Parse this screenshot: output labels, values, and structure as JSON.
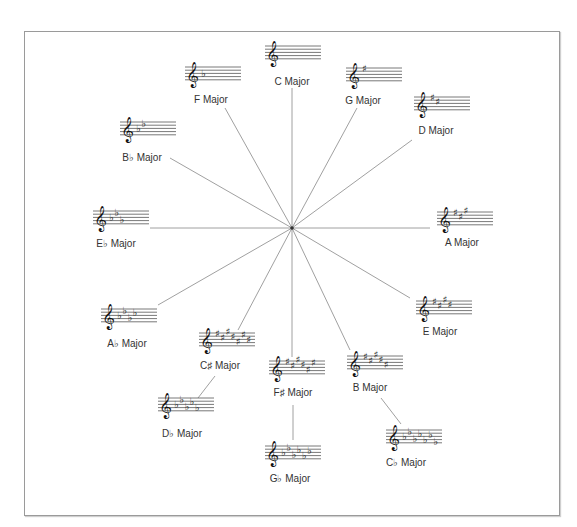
{
  "diagram": {
    "center": "hub",
    "keys": [
      {
        "id": "c",
        "label": "C Major",
        "accidental": "none",
        "count": 0
      },
      {
        "id": "g",
        "label": "G Major",
        "accidental": "sharp",
        "count": 1
      },
      {
        "id": "d",
        "label": "D Major",
        "accidental": "sharp",
        "count": 2
      },
      {
        "id": "a",
        "label": "A Major",
        "accidental": "sharp",
        "count": 3
      },
      {
        "id": "e",
        "label": "E Major",
        "accidental": "sharp",
        "count": 4
      },
      {
        "id": "b",
        "label": "B Major",
        "accidental": "sharp",
        "count": 5
      },
      {
        "id": "fs",
        "label": "F♯ Major",
        "accidental": "sharp",
        "count": 6
      },
      {
        "id": "cs",
        "label": "C♯ Major",
        "accidental": "sharp",
        "count": 7
      },
      {
        "id": "ab",
        "label": "A♭ Major",
        "accidental": "flat",
        "count": 4
      },
      {
        "id": "eb",
        "label": "E♭ Major",
        "accidental": "flat",
        "count": 3
      },
      {
        "id": "bb",
        "label": "B♭ Major",
        "accidental": "flat",
        "count": 2
      },
      {
        "id": "f",
        "label": "F Major",
        "accidental": "flat",
        "count": 1
      }
    ],
    "enharmonics": [
      {
        "id": "cb",
        "label": "C♭ Major",
        "accidental": "flat",
        "count": 7,
        "linked_to": "b"
      },
      {
        "id": "gb",
        "label": "G♭ Major",
        "accidental": "flat",
        "count": 6,
        "linked_to": "fs"
      },
      {
        "id": "db",
        "label": "D♭ Major",
        "accidental": "flat",
        "count": 5,
        "linked_to": "cs"
      }
    ]
  }
}
